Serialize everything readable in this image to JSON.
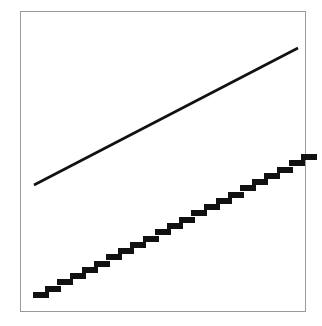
{
  "figure": {
    "name": "two-line-comparison-plot",
    "background_color": "#ffffff",
    "frame": {
      "name": "plot-frame",
      "stroke_color": "#9a9a9a",
      "stroke_width": 1,
      "x": 20,
      "y": 11,
      "width": 286,
      "height": 301
    }
  },
  "chart_data": {
    "type": "line",
    "title": "",
    "subtitle": "",
    "xlabel": "",
    "ylabel": "",
    "xlim": [
      0,
      1
    ],
    "ylim": [
      0,
      1
    ],
    "grid": false,
    "legend": null,
    "axis_ticks": {
      "x": [],
      "y": []
    },
    "annotations": [],
    "series": [
      {
        "name": "continuous-line",
        "style": "solid",
        "color": "#111111",
        "line_width": 2.6,
        "marker": "none",
        "x": [
          0.049,
          0.969
        ],
        "y": [
          0.545,
          0.877
        ],
        "pixel_start": [
          34,
          185
        ],
        "pixel_end": [
          298,
          48
        ]
      },
      {
        "name": "quantized-step-line",
        "style": "stepped-blocks",
        "color": "#111111",
        "block_width": 16,
        "block_height": 6,
        "step_x": 12.1,
        "step_y": 6.2,
        "block_count": 23,
        "pixel_start": [
          33,
          292
        ],
        "pixel_end": [
          301,
          154
        ],
        "x": [
          0.045,
          0.982
        ],
        "y": [
          0.0727,
          0.5316
        ]
      }
    ]
  }
}
